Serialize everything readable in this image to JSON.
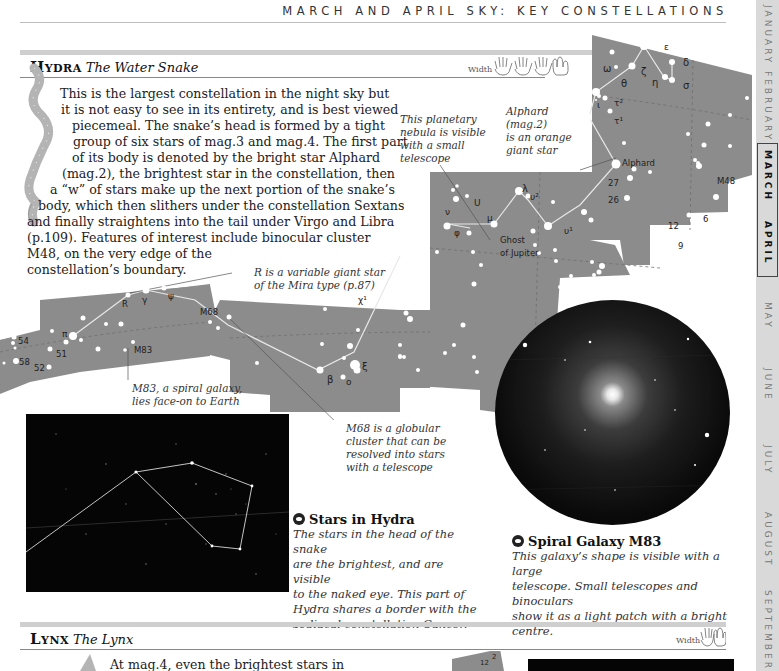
{
  "running_head": "MARCH AND APRIL SKY: KEY CONSTELLATIONS",
  "month_tabs": [
    {
      "label": "JANUARY",
      "active": false
    },
    {
      "label": "FEBRUARY",
      "active": false
    },
    {
      "label": "MARCH",
      "active": true
    },
    {
      "label": "APRIL",
      "active": true
    },
    {
      "label": "MAY",
      "active": false
    },
    {
      "label": "JUNE",
      "active": false
    },
    {
      "label": "JULY",
      "active": false
    },
    {
      "label": "AUGUST",
      "active": false
    },
    {
      "label": "SEPTEMBER",
      "active": false
    }
  ],
  "hydra": {
    "name": "Hydra",
    "subtitle": "The Water Snake",
    "width_label": "Width",
    "width_hands": 4,
    "body_lines": [
      "This is the largest constellation in the night sky but",
      "it is not easy to see in its entirety, and is best viewed",
      "piecemeal. The snake’s head is formed by a tight",
      "group of six stars of mag.3 and mag.4. The first part",
      "of its body is denoted by the bright star Alphard",
      "(mag.2), the brightest star in the constellation, then",
      "a “w” of stars make up the next portion of the snake’s",
      "body, which then slithers under the constellation Sextans",
      "and finally straightens into the tail under Virgo and Libra",
      "(p.109). Features of interest include binocular cluster",
      "M48, on the very edge of the",
      "constellation’s boundary."
    ],
    "annotations": {
      "planetary_nebula": [
        "This planetary",
        "nebula is visible",
        "with a small",
        "telescope"
      ],
      "alphard": [
        "Alphard",
        "(mag.2)",
        "is an orange",
        "giant star"
      ],
      "r_variable": [
        "R is a variable giant star",
        "of the Mira type (p.87)"
      ],
      "m83": [
        "M83, a spiral galaxy,",
        "lies face-on to Earth"
      ],
      "m68": [
        "M68 is a globular",
        "cluster that can be",
        "resolved into stars",
        "with a telescope"
      ]
    },
    "map_labels": {
      "omega": "ω",
      "zeta": "ζ",
      "epsilon": "ε",
      "delta": "δ",
      "theta": "θ",
      "eta": "η",
      "sigma": "σ",
      "iota": "ι",
      "tau2": "τ²",
      "tau1": "τ¹",
      "alphard": "Alphard",
      "n27": "27",
      "n26": "26",
      "m48": "M48",
      "lambda": "λ",
      "upsilon2": "υ²",
      "upsilon1": "υ¹",
      "U": "U",
      "nu": "ν",
      "mu": "μ",
      "phi": "φ",
      "ghost1": "Ghost",
      "ghost2": "of Jupiter",
      "n12": "12",
      "n6": "6",
      "n9": "9",
      "chi1": "χ¹",
      "xi": "ξ",
      "beta": "β",
      "omicron": "o",
      "M68": "M68",
      "R": "R",
      "gamma": "γ",
      "psi": "ψ",
      "pi": "π",
      "M83": "M83",
      "n54": "54",
      "n51": "51",
      "n58": "58",
      "n52": "52"
    },
    "photo_caption": {
      "title": "Stars in Hydra",
      "icon": "eye-icon",
      "lines": [
        "The stars in the head of the snake",
        "are the brightest, and are visible",
        "to the naked eye. This part of",
        "Hydra shares a border with the",
        "zodiacal constellation Cancer."
      ]
    },
    "galaxy_caption": {
      "title": "Spiral Galaxy M83",
      "icon": "telescope-icon",
      "lines": [
        "This galaxy’s shape is visible with a large",
        "telescope. Small telescopes and binoculars",
        "show it as a light patch with a bright centre."
      ]
    }
  },
  "lynx": {
    "name": "Lynx",
    "subtitle": "The Lynx",
    "width_label": "Width",
    "width_hands": 2,
    "body_first_line": "At mag.4, even the brightest stars in",
    "map_labels": {
      "n2": "2",
      "n12": "12"
    }
  },
  "colors": {
    "map_gray": "#8c8c8c",
    "tab_bg": "#d9d9d9",
    "section_bar": "#cfcfcf",
    "photo_bg": "#050505"
  }
}
